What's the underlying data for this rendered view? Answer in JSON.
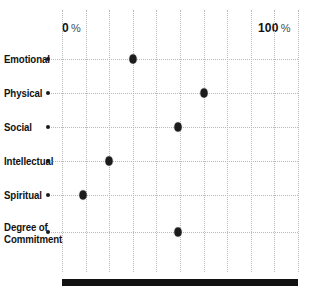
{
  "chart_data": {
    "type": "scatter",
    "title": "",
    "subtitle": "",
    "xlabel": "",
    "ylabel": "",
    "orientation": "horizontal",
    "xlim": [
      0,
      100
    ],
    "grid": true,
    "legend": null,
    "axis_min_label": "0",
    "axis_min_unit": "%",
    "axis_max_label": "100",
    "axis_max_unit": "%",
    "gridline_step": 10,
    "gridline_values": [
      0,
      10,
      20,
      30,
      40,
      50,
      60,
      70,
      80,
      90,
      100
    ],
    "categories": [
      "Emotional",
      "Physical",
      "Social",
      "Intellectual",
      "Spiritual",
      "Degree of Commitment"
    ],
    "category_lines": [
      [
        "Emotional"
      ],
      [
        "Physical"
      ],
      [
        "Social"
      ],
      [
        "Intellectual"
      ],
      [
        "Spiritual"
      ],
      [
        "Degree of",
        "Commitment"
      ]
    ],
    "values": [
      30,
      60,
      49,
      20,
      9,
      49
    ],
    "points": [
      {
        "category": "Emotional",
        "value": 30
      },
      {
        "category": "Physical",
        "value": 60
      },
      {
        "category": "Social",
        "value": 49
      },
      {
        "category": "Intellectual",
        "value": 20
      },
      {
        "category": "Spiritual",
        "value": 9
      },
      {
        "category": "Degree of Commitment",
        "value": 49
      }
    ],
    "marker_color": "#1c1c1c",
    "gridline_color": "#b9b9b9",
    "bar_color": "#111111",
    "background_color": "#ffffff"
  },
  "labels": {
    "cat0_l1": "Emotional",
    "cat1_l1": "Physical",
    "cat2_l1": "Social",
    "cat3_l1": "Intellectual",
    "cat4_l1": "Spiritual",
    "cat5_l1": "Degree of",
    "cat5_l2": "Commitment"
  },
  "scale": {
    "min_number": "0",
    "min_unit": "%",
    "max_number": "100",
    "max_unit": "%"
  }
}
